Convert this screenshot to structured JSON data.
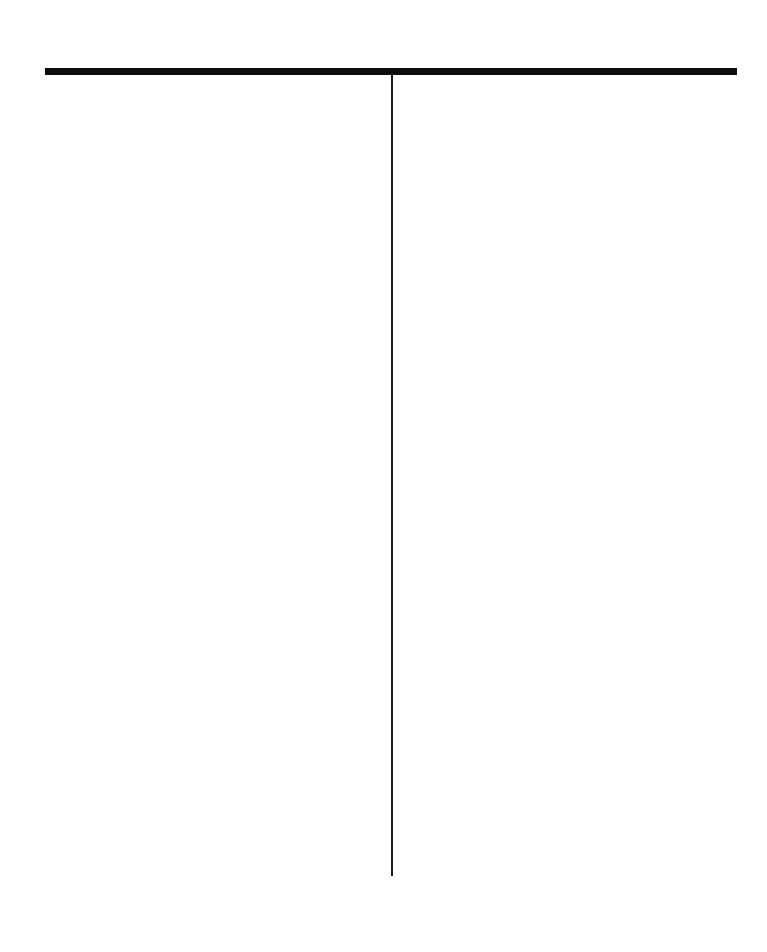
{
  "page": {
    "background_color": "#ffffff",
    "width": 767,
    "height": 952
  },
  "figure": {
    "name": "inverted-t-rule-diagram",
    "caption": "",
    "label": ""
  },
  "chart_data": {
    "type": "line",
    "title": "",
    "subtitle": "",
    "xlabel": "",
    "ylabel": "",
    "grid": false,
    "legend": null,
    "annotations": [],
    "elements": [
      {
        "id": "horizontal-rule",
        "role": "horizontal-rule",
        "orientation": "horizontal",
        "x_start": 45,
        "x_end": 737,
        "y": 71,
        "length": 692,
        "thickness": 7,
        "color": "#0d0d0d"
      },
      {
        "id": "vertical-stem",
        "role": "vertical-stem",
        "orientation": "vertical",
        "x": 392,
        "y_start": 74,
        "y_end": 876,
        "length": 802,
        "thickness": 2,
        "color": "#1a1a1a"
      }
    ],
    "junction": {
      "x": 392,
      "y": 71,
      "type": "tee"
    },
    "xlim": [
      0,
      767
    ],
    "ylim": [
      0,
      952
    ]
  }
}
